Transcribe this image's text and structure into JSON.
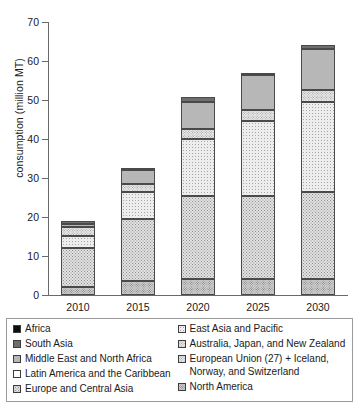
{
  "chart_data": {
    "type": "bar",
    "subtype": "stacked",
    "title": "",
    "xlabel": "",
    "ylabel": "consumption (million MT)",
    "categories": [
      "2010",
      "2015",
      "2020",
      "2025",
      "2030"
    ],
    "ylim": [
      0,
      70
    ],
    "yticks": [
      0,
      10,
      20,
      30,
      40,
      50,
      60,
      70
    ],
    "grid": false,
    "legend_position": "bottom",
    "stack_order_bottom_to_top": [
      "North America",
      "Europe and Central Asia",
      "East Asia and Pacific",
      "European Union (27) + Iceland, Norway, and Switzerland",
      "Middle East and North Africa",
      "South Asia",
      "Africa"
    ],
    "series": [
      {
        "name": "North America",
        "values": [
          2.0,
          3.5,
          4.0,
          4.0,
          4.0
        ]
      },
      {
        "name": "Europe and Central Asia",
        "values": [
          10.0,
          16.0,
          21.5,
          21.5,
          22.5
        ]
      },
      {
        "name": "East Asia and Pacific",
        "values": [
          3.2,
          7.0,
          14.5,
          19.0,
          23.0
        ]
      },
      {
        "name": "European Union (27) + Iceland, Norway, and Switzerland",
        "values": [
          2.3,
          2.0,
          2.5,
          3.0,
          3.0
        ]
      },
      {
        "name": "Middle East and North Africa",
        "values": [
          0.8,
          3.5,
          7.0,
          8.8,
          10.5
        ]
      },
      {
        "name": "South Asia",
        "values": [
          0.7,
          0.5,
          1.3,
          0.7,
          1.0
        ]
      },
      {
        "name": "Africa",
        "values": [
          0.0,
          0.0,
          0.0,
          0.0,
          0.0
        ]
      }
    ],
    "totals": [
      19.0,
      32.5,
      50.8,
      57.0,
      64.0
    ],
    "cumulative_boundaries": {
      "2010": [
        2.0,
        12.0,
        15.2,
        17.5,
        18.3,
        19.0,
        19.0
      ],
      "2015": [
        3.5,
        19.5,
        26.5,
        28.5,
        32.0,
        32.5,
        32.5
      ],
      "2020": [
        4.0,
        25.5,
        40.0,
        42.5,
        49.5,
        50.8,
        50.8
      ],
      "2025": [
        4.0,
        25.5,
        44.5,
        47.5,
        56.3,
        57.0,
        57.0
      ],
      "2030": [
        4.0,
        26.5,
        49.5,
        52.5,
        63.0,
        64.0,
        64.0
      ]
    }
  },
  "axis": {
    "y_label": "consumption (million MT)",
    "y_ticks": [
      "0",
      "10",
      "20",
      "30",
      "40",
      "50",
      "60",
      "70"
    ],
    "x_ticks": [
      "2010",
      "2015",
      "2020",
      "2025",
      "2030"
    ]
  },
  "legend": {
    "left_column": [
      {
        "label": "Africa",
        "swatch": "solid-black",
        "color": "#0d0d0d"
      },
      {
        "label": "South Asia",
        "swatch": "solid-dark-gray",
        "color": "#6e6e6e"
      },
      {
        "label": "Middle East and North Africa",
        "swatch": "solid-light-gray",
        "color": "#b7b7b7"
      },
      {
        "label": "Latin America and the Caribbean",
        "swatch": "white",
        "color": "#ffffff"
      },
      {
        "label": "Europe and Central Asia",
        "swatch": "dense-dotted",
        "color": "#e2e2e2"
      }
    ],
    "right_column": [
      {
        "label": "East Asia and Pacific",
        "swatch": "sparse-dotted",
        "color": "#ededed"
      },
      {
        "label": "Australia, Japan, and New Zealand",
        "swatch": "fine-dotted",
        "color": "#e8e8e8"
      },
      {
        "label": "European Union (27) + Iceland,\nNorway, and Switzerland",
        "swatch": "medium-dotted",
        "color": "#e8e8e8"
      },
      {
        "label": "North America",
        "swatch": "coarse-dotted",
        "color": "#cfcfcf"
      }
    ]
  }
}
